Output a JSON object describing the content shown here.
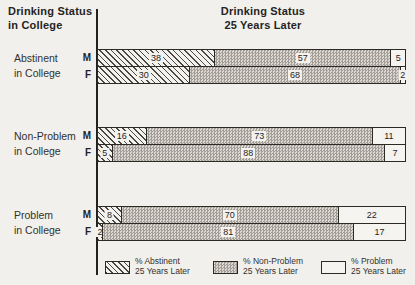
{
  "header_left": {
    "line1": "Drinking Status",
    "line2": "in College"
  },
  "title": {
    "line1": "Drinking Status",
    "line2": "25 Years Later"
  },
  "colors": {
    "background": "#f2f0ec",
    "border": "#2c2a25",
    "gray_fill": "#c0beb8",
    "hatch_line": "#2d2a25",
    "plain_fill": "#f6f4f0"
  },
  "legend": [
    {
      "pattern": "hatch",
      "label_line1": "% Abstinent",
      "label_line2": "25 Years Later"
    },
    {
      "pattern": "dots",
      "label_line1": "% Non-Problem",
      "label_line2": "25 Years Later"
    },
    {
      "pattern": "plain",
      "label_line1": "% Problem",
      "label_line2": "25 Years Later"
    }
  ],
  "chart_data": {
    "type": "bar",
    "orientation": "horizontal",
    "stacked": true,
    "x_range": [
      0,
      100
    ],
    "units": "percent",
    "series_names": [
      "% Abstinent 25 Years Later",
      "% Non-Problem 25 Years Later",
      "% Problem 25 Years Later"
    ],
    "groups": [
      {
        "label_line1": "Abstinent",
        "label_line2": "in College",
        "rows": [
          {
            "sex": "M",
            "values": [
              38,
              57,
              5
            ]
          },
          {
            "sex": "F",
            "values": [
              30,
              68,
              2
            ]
          }
        ]
      },
      {
        "label_line1": "Non-Problem",
        "label_line2": "in College",
        "rows": [
          {
            "sex": "M",
            "values": [
              16,
              73,
              11
            ]
          },
          {
            "sex": "F",
            "values": [
              5,
              88,
              7
            ]
          }
        ]
      },
      {
        "label_line1": "Problem",
        "label_line2": "in College",
        "rows": [
          {
            "sex": "M",
            "values": [
              8,
              70,
              22
            ]
          },
          {
            "sex": "F",
            "values": [
              2,
              81,
              17
            ]
          }
        ]
      }
    ]
  }
}
